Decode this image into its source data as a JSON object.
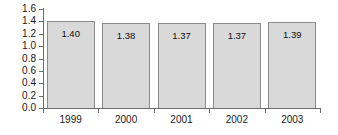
{
  "chart_data": {
    "type": "bar",
    "title": "",
    "subtitle": "",
    "xlabel": "",
    "ylabel": "",
    "categories": [
      "1999",
      "2000",
      "2001",
      "2002",
      "2003"
    ],
    "values": [
      1.4,
      1.38,
      1.37,
      1.37,
      1.39
    ],
    "value_labels": [
      "1.40",
      "1.38",
      "1.37",
      "1.37",
      "1.39"
    ],
    "ylim": [
      0.0,
      1.6
    ],
    "ytick_labels": [
      "1.6",
      "1.4",
      "1.2",
      "1.0",
      "0.8",
      "0.6",
      "0.4",
      "0.2",
      "0.0"
    ],
    "ytick_values": [
      1.6,
      1.4,
      1.2,
      1.0,
      0.8,
      0.6,
      0.4,
      0.2,
      0.0
    ],
    "ytick_step": 0.2,
    "grid": false,
    "legend": false,
    "legend_position": "none",
    "series": [
      {
        "name": "",
        "values": [
          1.4,
          1.38,
          1.37,
          1.37,
          1.39
        ]
      }
    ],
    "colors": {
      "bar_fill": "#d9d9d9",
      "bar_border": "#8c8c8c",
      "axis": "#6e6e6e",
      "text": "#1a1a1a",
      "background": "#ffffff"
    }
  }
}
